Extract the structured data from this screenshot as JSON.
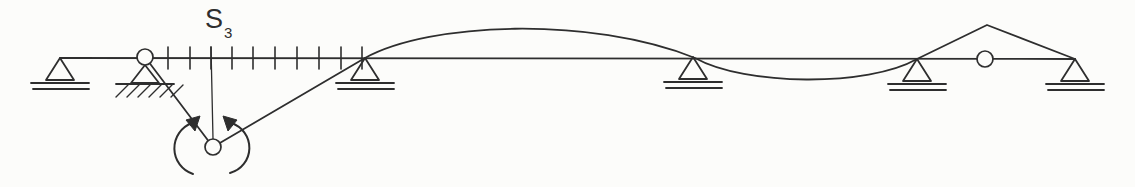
{
  "figure": {
    "canvas": {
      "width": 1135,
      "height": 187
    },
    "colors": {
      "ink": "#2e2e2e",
      "paper": "#fcfcfa"
    },
    "label": {
      "base": "S",
      "sub": "3"
    },
    "beam": {
      "x1": 60,
      "y1": 58,
      "x2": 1075,
      "y2": 59
    },
    "supports": [
      {
        "id": "a",
        "type": "roller",
        "x": 60,
        "y": 58
      },
      {
        "id": "b",
        "type": "pinned-hatched",
        "x": 145,
        "y": 58
      },
      {
        "id": "c",
        "type": "roller",
        "x": 365,
        "y": 58
      },
      {
        "id": "d",
        "type": "roller",
        "x": 693,
        "y": 57
      },
      {
        "id": "e",
        "type": "roller",
        "x": 917,
        "y": 59
      },
      {
        "id": "f",
        "type": "roller",
        "x": 1075,
        "y": 59
      }
    ],
    "hinges": [
      {
        "id": "support-b-hinge",
        "x": 145,
        "y": 57,
        "r": 8
      },
      {
        "id": "beam-hinge",
        "x": 985,
        "y": 59,
        "r": 8
      },
      {
        "id": "section-moment-hinge",
        "x": 213,
        "y": 147,
        "r": 8
      }
    ],
    "ticks": {
      "xs": [
        168,
        190,
        211,
        232,
        253,
        275,
        297,
        319,
        341,
        362
      ],
      "y1": 47,
      "y2": 69
    },
    "section_line": {
      "x1": 211,
      "y1": 47,
      "x2": 213,
      "y2": 139
    },
    "influence_line": {
      "path": "M145,57 L213,147 Q280,108 365,58 C430,22 590,16 695,58 C745,86 868,87 917,59 L987,25 L1075,59"
    },
    "moment_arrows": {
      "left": {
        "arc": "M193,174 A27,27 0 0 1 192,123",
        "head": "200,116 186,120 195,131"
      },
      "right": {
        "arc": "M230,173 A26,26 0 0 0 231,123",
        "head": "223,116 237,120 228,131"
      }
    }
  }
}
